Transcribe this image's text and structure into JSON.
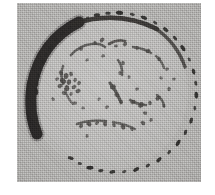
{
  "figure": {
    "kind": "scanned-grayscale-micrograph",
    "caption": "",
    "label": "",
    "plate": {
      "x": 17,
      "y": 3,
      "width": 184,
      "height": 179,
      "background_color": "#aaa9a7",
      "paper_color": "#ffffff",
      "texture": "halftone-dither"
    },
    "colors": {
      "paper": "#ffffff",
      "background_gray": "#aaa9a7",
      "interior_gray": "#b4b3b0",
      "ink_dark": "#1d1c1b",
      "ink_mid": "#3a3836",
      "ink_soft": "#55524f"
    }
  },
  "structures": {
    "outer_membrane": {
      "name": "outer-membrane-ring",
      "shape": "ellipse",
      "cx": 91,
      "cy": 89,
      "rx": 80,
      "ry": 78,
      "rotation": -6,
      "style": "beaded-dashed",
      "color": "#201f1d"
    },
    "thick_crescent": {
      "name": "thick-dark-crescent",
      "position": "left",
      "arc_start_deg": 128,
      "arc_end_deg": 238,
      "thickness_px": 11,
      "color": "#161514"
    },
    "inner_ring": {
      "name": "inner-broken-ring",
      "shape": "ellipse",
      "cx": 93,
      "cy": 84,
      "rx": 52,
      "ry": 46,
      "style": "fragmented",
      "color": "#3a3836"
    },
    "granule_cluster": {
      "name": "granule-cluster",
      "position": "left-of-centre",
      "cx": 53,
      "cy": 78,
      "count": 14
    },
    "granules_total": 56
  },
  "ring_beads": [
    {
      "t": 0.5,
      "w": 7.0,
      "h": 3.4,
      "o": 0.94
    },
    {
      "t": 0.52,
      "w": 5.4,
      "h": 3.2,
      "o": 0.88
    },
    {
      "t": 0.54,
      "w": 6.6,
      "h": 3.6,
      "o": 0.92
    },
    {
      "t": 0.56,
      "w": 4.4,
      "h": 2.9,
      "o": 0.8
    },
    {
      "t": 0.578,
      "w": 6.2,
      "h": 3.5,
      "o": 0.9
    },
    {
      "t": 0.598,
      "w": 5.0,
      "h": 3.0,
      "o": 0.84
    },
    {
      "t": 0.618,
      "w": 7.2,
      "h": 3.8,
      "o": 0.95
    },
    {
      "t": 0.64,
      "w": 4.6,
      "h": 2.8,
      "o": 0.78
    },
    {
      "t": 0.66,
      "w": 6.0,
      "h": 3.4,
      "o": 0.9
    },
    {
      "t": 0.682,
      "w": 5.2,
      "h": 3.0,
      "o": 0.82
    },
    {
      "t": 0.702,
      "w": 6.8,
      "h": 3.8,
      "o": 0.93
    },
    {
      "t": 0.724,
      "w": 4.2,
      "h": 2.7,
      "o": 0.74
    },
    {
      "t": 0.744,
      "w": 6.4,
      "h": 3.5,
      "o": 0.91
    },
    {
      "t": 0.766,
      "w": 5.6,
      "h": 3.2,
      "o": 0.86
    },
    {
      "t": 0.788,
      "w": 7.4,
      "h": 4.0,
      "o": 0.96
    },
    {
      "t": 0.812,
      "w": 5.0,
      "h": 3.0,
      "o": 0.82
    },
    {
      "t": 0.834,
      "w": 6.6,
      "h": 3.6,
      "o": 0.92
    },
    {
      "t": 0.856,
      "w": 4.8,
      "h": 2.9,
      "o": 0.79
    },
    {
      "t": 0.878,
      "w": 6.2,
      "h": 3.4,
      "o": 0.89
    },
    {
      "t": 0.9,
      "w": 5.4,
      "h": 3.1,
      "o": 0.84
    },
    {
      "t": 0.922,
      "w": 7.0,
      "h": 3.7,
      "o": 0.94
    },
    {
      "t": 0.944,
      "w": 4.4,
      "h": 2.8,
      "o": 0.76
    },
    {
      "t": 0.966,
      "w": 6.0,
      "h": 3.4,
      "o": 0.9
    },
    {
      "t": 0.986,
      "w": 5.2,
      "h": 3.0,
      "o": 0.83
    },
    {
      "t": 0.006,
      "w": 6.8,
      "h": 3.6,
      "o": 0.92
    },
    {
      "t": 0.028,
      "w": 4.6,
      "h": 2.8,
      "o": 0.78
    },
    {
      "t": 0.05,
      "w": 6.2,
      "h": 3.4,
      "o": 0.88
    },
    {
      "t": 0.072,
      "w": 5.6,
      "h": 3.2,
      "o": 0.85
    },
    {
      "t": 0.094,
      "w": 7.0,
      "h": 3.6,
      "o": 0.93
    },
    {
      "t": 0.116,
      "w": 4.8,
      "h": 2.9,
      "o": 0.8
    },
    {
      "t": 0.138,
      "w": 6.4,
      "h": 3.5,
      "o": 0.9
    },
    {
      "t": 0.16,
      "w": 5.0,
      "h": 3.0,
      "o": 0.82
    },
    {
      "t": 0.182,
      "w": 6.6,
      "h": 3.6,
      "o": 0.91
    },
    {
      "t": 0.204,
      "w": 4.4,
      "h": 2.8,
      "o": 0.76
    },
    {
      "t": 0.226,
      "w": 6.0,
      "h": 3.4,
      "o": 0.89
    },
    {
      "t": 0.248,
      "w": 5.4,
      "h": 3.1,
      "o": 0.84
    },
    {
      "t": 0.27,
      "w": 7.2,
      "h": 3.8,
      "o": 0.95
    },
    {
      "t": 0.292,
      "w": 4.6,
      "h": 2.8,
      "o": 0.78
    },
    {
      "t": 0.314,
      "w": 6.2,
      "h": 3.4,
      "o": 0.88
    }
  ],
  "inner_fragments": [
    {
      "d": "M 54 52 q 9 -10 21 -11 q 8 -1 13 3",
      "w": 2.6,
      "o": 0.8
    },
    {
      "d": "M 92 41 q 8 -5 16 -3",
      "w": 2.8,
      "o": 0.86
    },
    {
      "d": "M 116 44 q 10 1 18 6",
      "w": 2.5,
      "o": 0.78
    },
    {
      "d": "M 139 53 q 6 5 8 12",
      "w": 2.4,
      "o": 0.74
    },
    {
      "d": "M 46 63 q -3 9 0 18",
      "w": 2.5,
      "o": 0.76
    },
    {
      "d": "M 48 86 q 2 9 8 15",
      "w": 2.3,
      "o": 0.7
    },
    {
      "d": "M 101 57 q 5 7 4 15",
      "w": 2.6,
      "o": 0.8
    },
    {
      "d": "M 93 80 q 7 9 11 19",
      "w": 3.2,
      "o": 0.9
    },
    {
      "d": "M 113 97 q 9 5 16 5",
      "w": 2.6,
      "o": 0.8
    },
    {
      "d": "M 140 92 q 6 4 7 11",
      "w": 2.5,
      "o": 0.78
    },
    {
      "d": "M 60 121 q 14 -5 29 -3",
      "w": 2.6,
      "o": 0.8
    },
    {
      "d": "M 96 119 q 12 2 22 7",
      "w": 2.4,
      "o": 0.74
    }
  ],
  "granules": [
    {
      "cx": 44,
      "cy": 70,
      "r": 2.6,
      "o": 0.8
    },
    {
      "cx": 49,
      "cy": 73,
      "r": 3.1,
      "o": 0.86
    },
    {
      "cx": 54,
      "cy": 71,
      "r": 2.4,
      "o": 0.78
    },
    {
      "cx": 46,
      "cy": 78,
      "r": 3.3,
      "o": 0.88
    },
    {
      "cx": 52,
      "cy": 79,
      "r": 2.8,
      "o": 0.84
    },
    {
      "cx": 58,
      "cy": 77,
      "r": 2.2,
      "o": 0.74
    },
    {
      "cx": 43,
      "cy": 83,
      "r": 2.6,
      "o": 0.8
    },
    {
      "cx": 50,
      "cy": 85,
      "r": 3.0,
      "o": 0.86
    },
    {
      "cx": 57,
      "cy": 84,
      "r": 2.5,
      "o": 0.78
    },
    {
      "cx": 62,
      "cy": 80,
      "r": 2.3,
      "o": 0.74
    },
    {
      "cx": 47,
      "cy": 90,
      "r": 2.4,
      "o": 0.76
    },
    {
      "cx": 54,
      "cy": 91,
      "r": 2.0,
      "o": 0.7
    },
    {
      "cx": 61,
      "cy": 88,
      "r": 2.6,
      "o": 0.8
    },
    {
      "cx": 40,
      "cy": 76,
      "r": 2.0,
      "o": 0.7
    },
    {
      "cx": 78,
      "cy": 40,
      "r": 2.2,
      "o": 0.76
    },
    {
      "cx": 85,
      "cy": 37,
      "r": 2.6,
      "o": 0.82
    },
    {
      "cx": 99,
      "cy": 43,
      "r": 2.0,
      "o": 0.72
    },
    {
      "cx": 108,
      "cy": 41,
      "r": 2.4,
      "o": 0.78
    },
    {
      "cx": 120,
      "cy": 45,
      "r": 2.1,
      "o": 0.72
    },
    {
      "cx": 131,
      "cy": 48,
      "r": 2.5,
      "o": 0.8
    },
    {
      "cx": 142,
      "cy": 56,
      "r": 2.2,
      "o": 0.74
    },
    {
      "cx": 150,
      "cy": 66,
      "r": 2.0,
      "o": 0.7
    },
    {
      "cx": 106,
      "cy": 60,
      "r": 2.3,
      "o": 0.76
    },
    {
      "cx": 103,
      "cy": 70,
      "r": 2.1,
      "o": 0.72
    },
    {
      "cx": 96,
      "cy": 84,
      "r": 3.0,
      "o": 0.9
    },
    {
      "cx": 100,
      "cy": 92,
      "r": 2.7,
      "o": 0.86
    },
    {
      "cx": 104,
      "cy": 99,
      "r": 2.4,
      "o": 0.8
    },
    {
      "cx": 116,
      "cy": 99,
      "r": 2.6,
      "o": 0.84
    },
    {
      "cx": 124,
      "cy": 102,
      "r": 3.0,
      "o": 0.88
    },
    {
      "cx": 133,
      "cy": 100,
      "r": 2.3,
      "o": 0.78
    },
    {
      "cx": 141,
      "cy": 95,
      "r": 2.8,
      "o": 0.86
    },
    {
      "cx": 147,
      "cy": 103,
      "r": 2.0,
      "o": 0.7
    },
    {
      "cx": 128,
      "cy": 110,
      "r": 2.2,
      "o": 0.74
    },
    {
      "cx": 120,
      "cy": 86,
      "r": 2.0,
      "o": 0.7
    },
    {
      "cx": 64,
      "cy": 123,
      "r": 2.4,
      "o": 0.8
    },
    {
      "cx": 72,
      "cy": 121,
      "r": 2.8,
      "o": 0.86
    },
    {
      "cx": 80,
      "cy": 120,
      "r": 2.2,
      "o": 0.76
    },
    {
      "cx": 88,
      "cy": 121,
      "r": 2.6,
      "o": 0.82
    },
    {
      "cx": 97,
      "cy": 122,
      "r": 2.3,
      "o": 0.78
    },
    {
      "cx": 106,
      "cy": 124,
      "r": 2.7,
      "o": 0.84
    },
    {
      "cx": 115,
      "cy": 126,
      "r": 2.1,
      "o": 0.72
    },
    {
      "cx": 126,
      "cy": 120,
      "r": 2.5,
      "o": 0.8
    },
    {
      "cx": 134,
      "cy": 117,
      "r": 2.0,
      "o": 0.7
    },
    {
      "cx": 58,
      "cy": 100,
      "r": 2.1,
      "o": 0.7
    },
    {
      "cx": 66,
      "cy": 105,
      "r": 1.9,
      "o": 0.66
    },
    {
      "cx": 152,
      "cy": 86,
      "r": 2.2,
      "o": 0.74
    },
    {
      "cx": 157,
      "cy": 76,
      "r": 1.9,
      "o": 0.68
    },
    {
      "cx": 86,
      "cy": 53,
      "r": 2.0,
      "o": 0.7
    },
    {
      "cx": 70,
      "cy": 57,
      "r": 1.9,
      "o": 0.66
    },
    {
      "cx": 64,
      "cy": 46,
      "r": 2.1,
      "o": 0.72
    },
    {
      "cx": 112,
      "cy": 74,
      "r": 1.9,
      "o": 0.66
    },
    {
      "cx": 90,
      "cy": 104,
      "r": 2.0,
      "o": 0.7
    },
    {
      "cx": 82,
      "cy": 96,
      "r": 1.8,
      "o": 0.64
    },
    {
      "cx": 144,
      "cy": 75,
      "r": 1.9,
      "o": 0.66
    },
    {
      "cx": 36,
      "cy": 96,
      "r": 2.0,
      "o": 0.7
    },
    {
      "cx": 70,
      "cy": 133,
      "r": 2.0,
      "o": 0.7
    }
  ]
}
